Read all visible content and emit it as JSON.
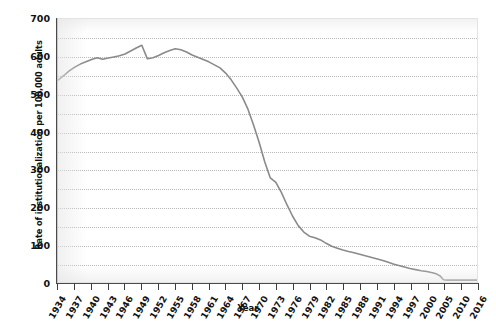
{
  "chart_data": {
    "type": "line",
    "title": "",
    "xlabel": "Year",
    "ylabel": "Rate of institutionalization per 100,000 adults",
    "xlim": [
      1934,
      2016
    ],
    "ylim": [
      0,
      700
    ],
    "grid": true,
    "grid_interval": 50,
    "legend": "none",
    "line_color": "#8a8a8a",
    "y_ticks": [
      700,
      600,
      500,
      400,
      300,
      200,
      100,
      0
    ],
    "y_tick_labels": [
      "700",
      "600",
      "500",
      "400",
      "300",
      "200",
      "100",
      "0"
    ],
    "x_tick_labels": [
      "1934",
      "1937",
      "1940",
      "1943",
      "1946",
      "1949",
      "1952",
      "1955",
      "1958",
      "1961",
      "1964",
      "1967",
      "1970",
      "1973",
      "1976",
      "1979",
      "1982",
      "1985",
      "1988",
      "1991",
      "1994",
      "1997",
      "2000",
      "2005",
      "2010",
      "2016"
    ],
    "x": [
      1934,
      1935,
      1936,
      1937,
      1938,
      1939,
      1940,
      1941,
      1942,
      1943,
      1944,
      1945,
      1946,
      1947,
      1948,
      1949,
      1950,
      1951,
      1952,
      1953,
      1954,
      1955,
      1956,
      1957,
      1958,
      1959,
      1960,
      1961,
      1962,
      1963,
      1964,
      1965,
      1966,
      1967,
      1968,
      1969,
      1970,
      1971,
      1972,
      1973,
      1974,
      1975,
      1976,
      1977,
      1978,
      1979,
      1980,
      1981,
      1982,
      1983,
      1984,
      1985,
      1986,
      1987,
      1988,
      1989,
      1990,
      1991,
      1992,
      1993,
      1994,
      1995,
      1996,
      1997,
      1998,
      1999,
      2000,
      2001,
      2002,
      2003,
      2004,
      2005,
      2006,
      2007,
      2008,
      2009,
      2010,
      2011,
      2012,
      2013,
      2014,
      2015,
      2016
    ],
    "values": [
      537,
      549,
      562,
      572,
      580,
      586,
      592,
      597,
      593,
      596,
      599,
      602,
      607,
      615,
      623,
      630,
      594,
      597,
      603,
      610,
      616,
      621,
      618,
      612,
      604,
      598,
      592,
      586,
      578,
      570,
      556,
      538,
      516,
      492,
      460,
      418,
      372,
      320,
      277,
      265,
      238,
      205,
      175,
      150,
      133,
      122,
      118,
      112,
      103,
      95,
      90,
      85,
      81,
      78,
      74,
      70,
      66,
      62,
      58,
      53,
      48,
      44,
      40,
      36,
      33,
      30,
      28,
      26,
      24,
      21,
      16,
      6,
      5,
      5,
      5,
      5,
      5,
      5,
      5,
      5,
      5,
      5,
      5
    ],
    "series_name": "Rate of institutionalization"
  }
}
